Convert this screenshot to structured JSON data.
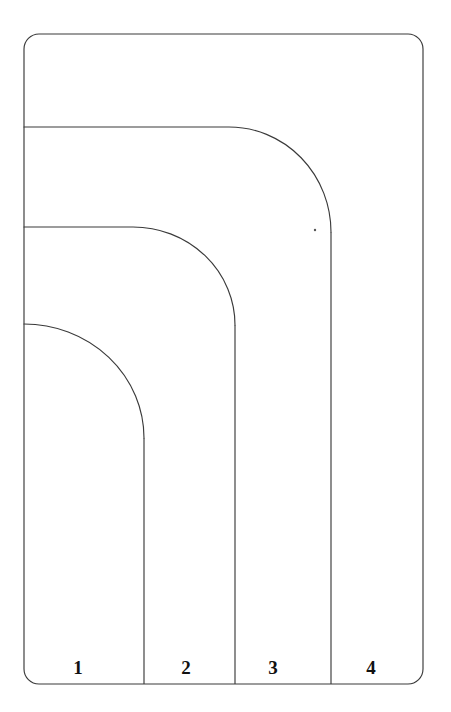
{
  "figure": {
    "kind": "nested-rounded-zone-diagram",
    "background_color": "#ffffff",
    "stroke_color": "#3a3a3a",
    "label_color": "#111111",
    "canvas": {
      "width": 451,
      "height": 712
    }
  },
  "outer_boundary": {
    "name": "outer-rounded-rectangle",
    "left": 24,
    "top": 34,
    "right": 423,
    "bottom": 684,
    "corner_radius": 15
  },
  "zones": [
    {
      "label": "1",
      "label_x": 78,
      "label_y": 674,
      "curve_top_y": 324,
      "curve_end_x": 144,
      "curve_end_y": 438,
      "divider_x": 144
    },
    {
      "label": "2",
      "label_x": 186,
      "label_y": 674,
      "curve_top_y": 227,
      "curve_end_x": 235,
      "curve_end_y": 325,
      "divider_x": 235
    },
    {
      "label": "3",
      "label_x": 273,
      "label_y": 674,
      "curve_top_y": 127,
      "curve_end_x": 331,
      "curve_end_y": 232,
      "divider_x": 331
    },
    {
      "label": "4",
      "label_x": 371,
      "label_y": 674,
      "curve_top_y": 34,
      "curve_end_x": 423,
      "curve_end_y": 49,
      "divider_x": 423
    }
  ],
  "marks": [
    {
      "name": "ink-speck",
      "x": 315,
      "y": 230,
      "r": 1.2
    }
  ]
}
